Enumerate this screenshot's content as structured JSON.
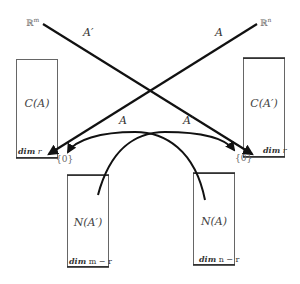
{
  "diagram": {
    "title": "",
    "spaces": {
      "domain_left": {
        "symbol": "ℝ",
        "exponent": "m"
      },
      "domain_right": {
        "symbol": "ℝ",
        "exponent": "n"
      }
    },
    "maps": {
      "straight_from_left": "A′",
      "straight_from_right": "A",
      "curve_to_left_zero": "A",
      "curve_to_right_zero": "A′"
    },
    "boxes": [
      {
        "id": "column-space-A",
        "label": "C(A)",
        "dim_word": "dim",
        "dim_value": "r"
      },
      {
        "id": "column-space-A-transpose",
        "label": "C(A′)",
        "dim_word": "dim",
        "dim_value": "r"
      },
      {
        "id": "null-space-A-transpose",
        "label": "N(A′)",
        "dim_word": "dim",
        "dim_value": "m − r"
      },
      {
        "id": "null-space-A",
        "label": "N(A)",
        "dim_word": "dim",
        "dim_value": "n − r"
      }
    ],
    "zero_labels": [
      "{0}",
      "{0}"
    ],
    "colors": {
      "line": "#111111",
      "box_border": "#555555",
      "box_bottom": "#222222",
      "text": "#444444"
    }
  }
}
